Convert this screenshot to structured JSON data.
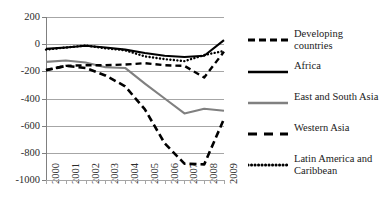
{
  "title_cropped": "",
  "chart_data": {
    "type": "line",
    "title": "",
    "xlabel": "",
    "ylabel": "",
    "x": [
      "2000",
      "2001",
      "2002",
      "2003",
      "2004",
      "2005",
      "2006",
      "2007",
      "2008",
      "2009"
    ],
    "ylim": [
      -1000,
      200
    ],
    "ytick_labels": [
      "200",
      "0",
      "-200",
      "-400",
      "-600",
      "-800",
      "-1000"
    ],
    "ytick_values": [
      200,
      0,
      -200,
      -400,
      -600,
      -800,
      -1000
    ],
    "grid": true,
    "legend_position": "right",
    "series": [
      {
        "name": "Developing countries",
        "style": "heavy-dashed",
        "color": "#000000",
        "values": [
          -192,
          -160,
          -175,
          -230,
          -310,
          -480,
          -730,
          -880,
          -885,
          -550
        ]
      },
      {
        "name": "Africa",
        "style": "solid",
        "color": "#000000",
        "values": [
          -35,
          -25,
          -12,
          -25,
          -40,
          -65,
          -85,
          -95,
          -85,
          30
        ]
      },
      {
        "name": "East and South Asia",
        "style": "solid",
        "color": "#808080",
        "values": [
          -130,
          -120,
          -135,
          -170,
          -175,
          -290,
          -400,
          -510,
          -475,
          -490
        ]
      },
      {
        "name": "Western Asia",
        "style": "long-dashed",
        "color": "#000000",
        "values": [
          -190,
          -160,
          -155,
          -155,
          -150,
          -140,
          -155,
          -160,
          -245,
          -55
        ]
      },
      {
        "name": "Latin America and Caribbean",
        "style": "dotted",
        "color": "#000000",
        "values": [
          -40,
          -25,
          -10,
          -30,
          -45,
          -90,
          -110,
          -125,
          -80,
          -50
        ]
      }
    ]
  },
  "legend": {
    "items": [
      {
        "label": "Developing countries",
        "swatch": "heavy-dashed-swatch"
      },
      {
        "label": "Africa",
        "swatch": "solid-black-swatch"
      },
      {
        "label": "East and South Asia",
        "swatch": "solid-gray-swatch"
      },
      {
        "label": "Western Asia",
        "swatch": "long-dashed-swatch"
      },
      {
        "label": "Latin America and Caribbean",
        "swatch": "dotted-swatch"
      }
    ]
  }
}
